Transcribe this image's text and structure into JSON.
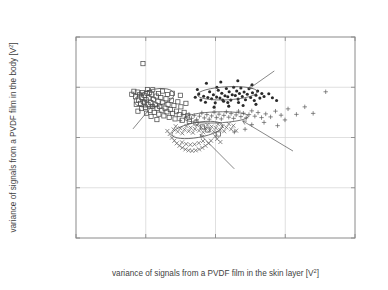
{
  "chart_data": {
    "type": "scatter",
    "title": "",
    "xlabel": "variance of signals from a PVDF film in the skin layer [V²]",
    "ylabel": "variance of signals from a PVDF film in the body [V²]",
    "xlim": [
      0,
      0.02
    ],
    "ylim": [
      0,
      0.02
    ],
    "xticks": [
      0,
      0.005,
      0.01,
      0.015,
      0.02
    ],
    "xticklabels": [
      "0",
      "0.005",
      "0.01",
      "0.015",
      "0.02"
    ],
    "yticks": [
      0,
      0.005,
      0.01,
      0.015,
      0.02
    ],
    "yticklabels": [
      "0",
      "0.005",
      "0.01",
      "0.015",
      "0.02"
    ],
    "grid": true,
    "legend_position": "none",
    "annotations": [
      {
        "label": "wood",
        "text_x": 0.0039,
        "text_y": 0.01055,
        "point_x": 0.00555,
        "point_y": 0.0133
      },
      {
        "label": "vinyl",
        "text_x": 0.01445,
        "text_y": 0.01685,
        "point_x": 0.0124,
        "point_y": 0.01485
      },
      {
        "label": "paper",
        "text_x": 0.01155,
        "text_y": 0.0066,
        "point_x": 0.0089,
        "point_y": 0.0103
      },
      {
        "label": "cork",
        "text_x": 0.0158,
        "text_y": 0.00845,
        "point_x": 0.01195,
        "point_y": 0.01165
      }
    ],
    "ellipses": [
      {
        "name": "wood",
        "cx": 0.0056,
        "cy": 0.01395,
        "rx": 0.00145,
        "ry": 0.00085,
        "angle": -12
      },
      {
        "name": "vinyl",
        "cx": 0.01085,
        "cy": 0.0144,
        "rx": 0.00215,
        "ry": 0.00065,
        "angle": -3
      },
      {
        "name": "cork",
        "cx": 0.01005,
        "cy": 0.012,
        "rx": 0.0023,
        "ry": 0.00055,
        "angle": -2
      },
      {
        "name": "paper",
        "cx": 0.0087,
        "cy": 0.01075,
        "rx": 0.00185,
        "ry": 0.00075,
        "angle": -10
      }
    ],
    "series": [
      {
        "name": "wood",
        "marker": "open-square",
        "points": [
          [
            0.0048,
            0.01735
          ],
          [
            0.004,
            0.0143
          ],
          [
            0.00415,
            0.0146
          ],
          [
            0.00428,
            0.01405
          ],
          [
            0.0044,
            0.01452
          ],
          [
            0.00448,
            0.01372
          ],
          [
            0.00455,
            0.01425
          ],
          [
            0.00462,
            0.0134
          ],
          [
            0.0047,
            0.01398
          ],
          [
            0.00476,
            0.01448
          ],
          [
            0.00483,
            0.01355
          ],
          [
            0.0049,
            0.0142
          ],
          [
            0.00497,
            0.013
          ],
          [
            0.00503,
            0.01375
          ],
          [
            0.0051,
            0.0144
          ],
          [
            0.00516,
            0.0133
          ],
          [
            0.00522,
            0.01395
          ],
          [
            0.0053,
            0.0127
          ],
          [
            0.00536,
            0.01348
          ],
          [
            0.00542,
            0.0143
          ],
          [
            0.00548,
            0.0131
          ],
          [
            0.00555,
            0.01378
          ],
          [
            0.00561,
            0.0125
          ],
          [
            0.00568,
            0.01325
          ],
          [
            0.00575,
            0.01412
          ],
          [
            0.00581,
            0.0129
          ],
          [
            0.00588,
            0.0136
          ],
          [
            0.00594,
            0.01232
          ],
          [
            0.006,
            0.0131
          ],
          [
            0.00608,
            0.01398
          ],
          [
            0.00615,
            0.01272
          ],
          [
            0.00622,
            0.01345
          ],
          [
            0.0063,
            0.01215
          ],
          [
            0.00638,
            0.01292
          ],
          [
            0.00645,
            0.01385
          ],
          [
            0.00652,
            0.01255
          ],
          [
            0.0066,
            0.0133
          ],
          [
            0.00668,
            0.012
          ],
          [
            0.00676,
            0.01278
          ],
          [
            0.00684,
            0.0137
          ],
          [
            0.00693,
            0.0124
          ],
          [
            0.00702,
            0.01318
          ],
          [
            0.0071,
            0.01185
          ],
          [
            0.0072,
            0.01262
          ],
          [
            0.0073,
            0.01355
          ],
          [
            0.0074,
            0.01228
          ],
          [
            0.00752,
            0.01305
          ],
          [
            0.00762,
            0.01172
          ],
          [
            0.00775,
            0.0125
          ],
          [
            0.00788,
            0.0134
          ],
          [
            0.008,
            0.01215
          ],
          [
            0.00812,
            0.0116
          ],
          [
            0.0055,
            0.01475
          ],
          [
            0.00512,
            0.01478
          ],
          [
            0.0062,
            0.01462
          ],
          [
            0.0069,
            0.0144
          ],
          [
            0.00748,
            0.0142
          ],
          [
            0.0047,
            0.01288
          ],
          [
            0.00505,
            0.01242
          ],
          [
            0.00538,
            0.0121
          ],
          [
            0.0058,
            0.01178
          ],
          [
            0.0086,
            0.01145
          ],
          [
            0.00905,
            0.01105
          ],
          [
            0.00945,
            0.01075
          ],
          [
            0.0102,
            0.01035
          ],
          [
            0.00432,
            0.0133
          ],
          [
            0.00444,
            0.01262
          ],
          [
            0.00492,
            0.01348
          ],
          [
            0.00528,
            0.01448
          ],
          [
            0.00592,
            0.01438
          ],
          [
            0.00655,
            0.01428
          ]
        ]
      },
      {
        "name": "vinyl",
        "marker": "filled-dot",
        "points": [
          [
            0.00855,
            0.014
          ],
          [
            0.0088,
            0.01432
          ],
          [
            0.00895,
            0.01372
          ],
          [
            0.00915,
            0.0141
          ],
          [
            0.00928,
            0.0135
          ],
          [
            0.00945,
            0.01398
          ],
          [
            0.00958,
            0.01455
          ],
          [
            0.00972,
            0.01385
          ],
          [
            0.00985,
            0.01425
          ],
          [
            0.00998,
            0.01345
          ],
          [
            0.01008,
            0.01402
          ],
          [
            0.0102,
            0.0147
          ],
          [
            0.01032,
            0.01392
          ],
          [
            0.01045,
            0.0144
          ],
          [
            0.01058,
            0.0136
          ],
          [
            0.01068,
            0.01415
          ],
          [
            0.01078,
            0.01488
          ],
          [
            0.01088,
            0.01405
          ],
          [
            0.01098,
            0.01455
          ],
          [
            0.0111,
            0.01372
          ],
          [
            0.0112,
            0.01425
          ],
          [
            0.0113,
            0.015
          ],
          [
            0.01142,
            0.01418
          ],
          [
            0.01152,
            0.01462
          ],
          [
            0.01162,
            0.01382
          ],
          [
            0.01172,
            0.01438
          ],
          [
            0.01182,
            0.01492
          ],
          [
            0.01192,
            0.01408
          ],
          [
            0.01205,
            0.01452
          ],
          [
            0.01215,
            0.01375
          ],
          [
            0.01228,
            0.0143
          ],
          [
            0.0124,
            0.01485
          ],
          [
            0.01252,
            0.01398
          ],
          [
            0.01265,
            0.01445
          ],
          [
            0.01278,
            0.01368
          ],
          [
            0.0129,
            0.0142
          ],
          [
            0.01302,
            0.01462
          ],
          [
            0.01318,
            0.01392
          ],
          [
            0.01332,
            0.01438
          ],
          [
            0.01348,
            0.01408
          ],
          [
            0.01038,
            0.01552
          ],
          [
            0.00935,
            0.0154
          ],
          [
            0.0116,
            0.01565
          ],
          [
            0.0087,
            0.01478
          ],
          [
            0.01262,
            0.01525
          ],
          [
            0.01382,
            0.01435
          ],
          [
            0.01408,
            0.01395
          ],
          [
            0.01438,
            0.01368
          ],
          [
            0.01198,
            0.01318
          ],
          [
            0.01095,
            0.01312
          ],
          [
            0.0099,
            0.01302
          ],
          [
            0.0129,
            0.0133
          ],
          [
            0.0101,
            0.015
          ],
          [
            0.01088,
            0.01348
          ],
          [
            0.01165,
            0.01348
          ],
          [
            0.01052,
            0.01372
          ]
        ]
      },
      {
        "name": "cork",
        "marker": "plus",
        "points": [
          [
            0.0079,
            0.01205
          ],
          [
            0.0081,
            0.01232
          ],
          [
            0.00828,
            0.0119
          ],
          [
            0.00848,
            0.01218
          ],
          [
            0.00865,
            0.01178
          ],
          [
            0.00885,
            0.01212
          ],
          [
            0.00902,
            0.01245
          ],
          [
            0.0092,
            0.01195
          ],
          [
            0.00938,
            0.01228
          ],
          [
            0.00955,
            0.01182
          ],
          [
            0.00972,
            0.01215
          ],
          [
            0.0099,
            0.01252
          ],
          [
            0.01008,
            0.01198
          ],
          [
            0.01025,
            0.01232
          ],
          [
            0.01042,
            0.01185
          ],
          [
            0.0106,
            0.0122
          ],
          [
            0.01078,
            0.01255
          ],
          [
            0.01095,
            0.01202
          ],
          [
            0.01112,
            0.01238
          ],
          [
            0.0113,
            0.0119
          ],
          [
            0.01148,
            0.01225
          ],
          [
            0.01165,
            0.01262
          ],
          [
            0.01182,
            0.01208
          ],
          [
            0.012,
            0.01242
          ],
          [
            0.0122,
            0.01195
          ],
          [
            0.0124,
            0.01228
          ],
          [
            0.0126,
            0.01265
          ],
          [
            0.01282,
            0.01212
          ],
          [
            0.01305,
            0.01248
          ],
          [
            0.0133,
            0.01198
          ],
          [
            0.0136,
            0.01235
          ],
          [
            0.01395,
            0.01205
          ],
          [
            0.0143,
            0.01262
          ],
          [
            0.0147,
            0.01222
          ],
          [
            0.0152,
            0.01285
          ],
          [
            0.0158,
            0.0123
          ],
          [
            0.0164,
            0.01305
          ],
          [
            0.017,
            0.0124
          ],
          [
            0.0179,
            0.01455
          ],
          [
            0.01498,
            0.01175
          ],
          [
            0.00745,
            0.01168
          ],
          [
            0.00765,
            0.01228
          ],
          [
            0.0126,
            0.01128
          ],
          [
            0.01348,
            0.0115
          ],
          [
            0.01212,
            0.01082
          ],
          [
            0.01135,
            0.01055
          ],
          [
            0.01445,
            0.01118
          ]
        ]
      },
      {
        "name": "paper",
        "marker": "x",
        "points": [
          [
            0.007,
            0.0108
          ],
          [
            0.00715,
            0.01112
          ],
          [
            0.0073,
            0.01058
          ],
          [
            0.00748,
            0.01092
          ],
          [
            0.00762,
            0.01042
          ],
          [
            0.00778,
            0.01078
          ],
          [
            0.00792,
            0.01115
          ],
          [
            0.00808,
            0.01062
          ],
          [
            0.00822,
            0.01098
          ],
          [
            0.00838,
            0.01048
          ],
          [
            0.00852,
            0.01085
          ],
          [
            0.00868,
            0.01122
          ],
          [
            0.00882,
            0.01068
          ],
          [
            0.00898,
            0.01102
          ],
          [
            0.00912,
            0.01052
          ],
          [
            0.00928,
            0.0109
          ],
          [
            0.00942,
            0.01125
          ],
          [
            0.00958,
            0.01072
          ],
          [
            0.00972,
            0.01108
          ],
          [
            0.00988,
            0.01058
          ],
          [
            0.01002,
            0.01095
          ],
          [
            0.01018,
            0.01132
          ],
          [
            0.01032,
            0.01078
          ],
          [
            0.01048,
            0.01112
          ],
          [
            0.01062,
            0.01062
          ],
          [
            0.01078,
            0.011
          ],
          [
            0.01095,
            0.01135
          ],
          [
            0.01112,
            0.01082
          ],
          [
            0.01128,
            0.01118
          ],
          [
            0.01148,
            0.01068
          ],
          [
            0.00672,
            0.01035
          ],
          [
            0.00688,
            0.00998
          ],
          [
            0.00705,
            0.00968
          ],
          [
            0.00722,
            0.00942
          ],
          [
            0.00742,
            0.00918
          ],
          [
            0.00762,
            0.00898
          ],
          [
            0.00785,
            0.00882
          ],
          [
            0.00808,
            0.00872
          ],
          [
            0.00832,
            0.00868
          ],
          [
            0.00858,
            0.00872
          ],
          [
            0.00882,
            0.00882
          ],
          [
            0.00905,
            0.00898
          ],
          [
            0.00928,
            0.00918
          ],
          [
            0.0095,
            0.00942
          ],
          [
            0.00968,
            0.00968
          ],
          [
            0.0076,
            0.00952
          ],
          [
            0.0079,
            0.00935
          ],
          [
            0.0082,
            0.00928
          ],
          [
            0.0085,
            0.00932
          ],
          [
            0.0088,
            0.00945
          ],
          [
            0.0091,
            0.00965
          ],
          [
            0.00655,
            0.01065
          ],
          [
            0.00998,
            0.01012
          ],
          [
            0.01012,
            0.00985
          ],
          [
            0.01035,
            0.00955
          ]
        ]
      }
    ]
  }
}
